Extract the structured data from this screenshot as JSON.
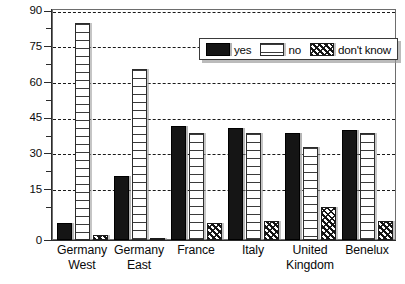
{
  "chart_data": {
    "type": "bar",
    "title": "",
    "xlabel": "",
    "ylabel": "",
    "ylim": [
      0,
      97
    ],
    "yticks": [
      0,
      15,
      30,
      45,
      60,
      75,
      90
    ],
    "ytick_labels": [
      "0",
      "15",
      "30",
      "45",
      "60",
      "75",
      "90"
    ],
    "grid": true,
    "legend_position": "top-right-inside",
    "categories": [
      "Germany West",
      "Germany East",
      "France",
      "Italy",
      "United Kingdom",
      "Benelux"
    ],
    "category_lines": [
      [
        "Germany",
        "West"
      ],
      [
        "Germany",
        "East"
      ],
      [
        "France",
        ""
      ],
      [
        "Italy",
        ""
      ],
      [
        "United",
        "Kingdom"
      ],
      [
        "Benelux",
        ""
      ]
    ],
    "series": [
      {
        "name": "yes",
        "key": "yes",
        "fill": "solid-black",
        "color": "#151515",
        "values": [
          7,
          27,
          48,
          47,
          45,
          46
        ]
      },
      {
        "name": "no",
        "key": "no",
        "fill": "horizontal-hatch",
        "color": "#ffffff",
        "values": [
          91,
          72,
          45,
          45,
          39,
          45
        ]
      },
      {
        "name": "don't know",
        "key": "dont_know",
        "fill": "cross-hatch-dense",
        "color": "#1b1b1b",
        "values": [
          2,
          1,
          7,
          8,
          14,
          8
        ]
      }
    ]
  },
  "legend": {
    "items": [
      {
        "label": "yes",
        "swatch": "solid-black-swatch"
      },
      {
        "label": "no",
        "swatch": "white-hatch-swatch"
      },
      {
        "label": "don't know",
        "swatch": "dense-hatch-swatch"
      }
    ]
  },
  "colors": {
    "frame": "#6d6d6d",
    "axis": "#2b2b2b",
    "grid": "#1a1a1a",
    "text": "#0a0a0a",
    "background": "#ffffff"
  }
}
